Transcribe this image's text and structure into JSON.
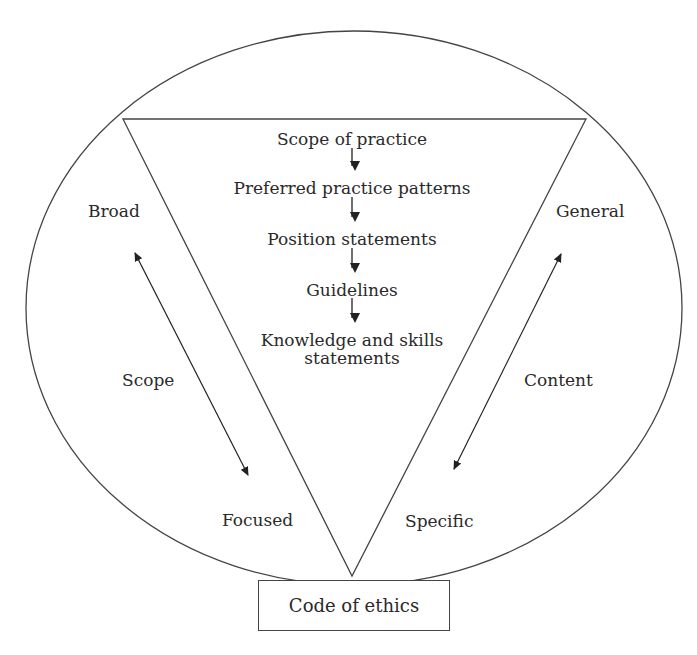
{
  "diagram": {
    "hierarchy": [
      {
        "label": "Scope of practice"
      },
      {
        "label": "Preferred practice patterns"
      },
      {
        "label": "Position statements"
      },
      {
        "label": "Guidelines"
      },
      {
        "label": "Knowledge and skills",
        "label2": "statements"
      }
    ],
    "left_axis": {
      "top_label": "Broad",
      "middle_label": "Scope",
      "bottom_label": "Focused"
    },
    "right_axis": {
      "top_label": "General",
      "middle_label": "Content",
      "bottom_label": "Specific"
    },
    "base": {
      "label": "Code of ethics"
    },
    "colors": {
      "stroke": "#444444",
      "text": "#2a2a2a",
      "background": "#ffffff"
    }
  }
}
